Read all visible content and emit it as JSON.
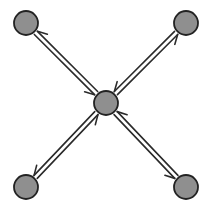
{
  "diagram": {
    "type": "star-network",
    "width": 211,
    "height": 217,
    "colors": {
      "node_fill": "#8f8f8f",
      "node_stroke": "#222222",
      "edge": "#2a2a2a",
      "background": "#ffffff"
    },
    "node_radius": 12,
    "nodes": [
      {
        "id": "center",
        "x": 106,
        "y": 103
      },
      {
        "id": "top-left",
        "x": 26,
        "y": 23
      },
      {
        "id": "top-right",
        "x": 186,
        "y": 23
      },
      {
        "id": "bottom-left",
        "x": 26,
        "y": 187
      },
      {
        "id": "bottom-right",
        "x": 186,
        "y": 187
      }
    ],
    "edges": [
      {
        "from": "top-left",
        "to": "center",
        "bidirectional": true,
        "style": "double-line-half-arrows"
      },
      {
        "from": "top-right",
        "to": "center",
        "bidirectional": true,
        "style": "double-line-half-arrows"
      },
      {
        "from": "bottom-left",
        "to": "center",
        "bidirectional": true,
        "style": "double-line-half-arrows"
      },
      {
        "from": "bottom-right",
        "to": "center",
        "bidirectional": true,
        "style": "double-line-half-arrows"
      }
    ]
  }
}
